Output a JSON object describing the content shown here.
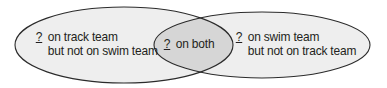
{
  "colors": {
    "outline": "#2b2b2b",
    "fill": "#eeeeee",
    "overlap_fill": "#d6d6d6",
    "text": "#231f20",
    "background": "#ffffff"
  },
  "venn": {
    "left_set": {
      "blank": "?",
      "line1": "on track team",
      "line2": "but not on swim team"
    },
    "intersection": {
      "blank": "?",
      "line1": "on both"
    },
    "right_set": {
      "blank": "?",
      "line1": "on swim team",
      "line2": "but not on track team"
    }
  }
}
